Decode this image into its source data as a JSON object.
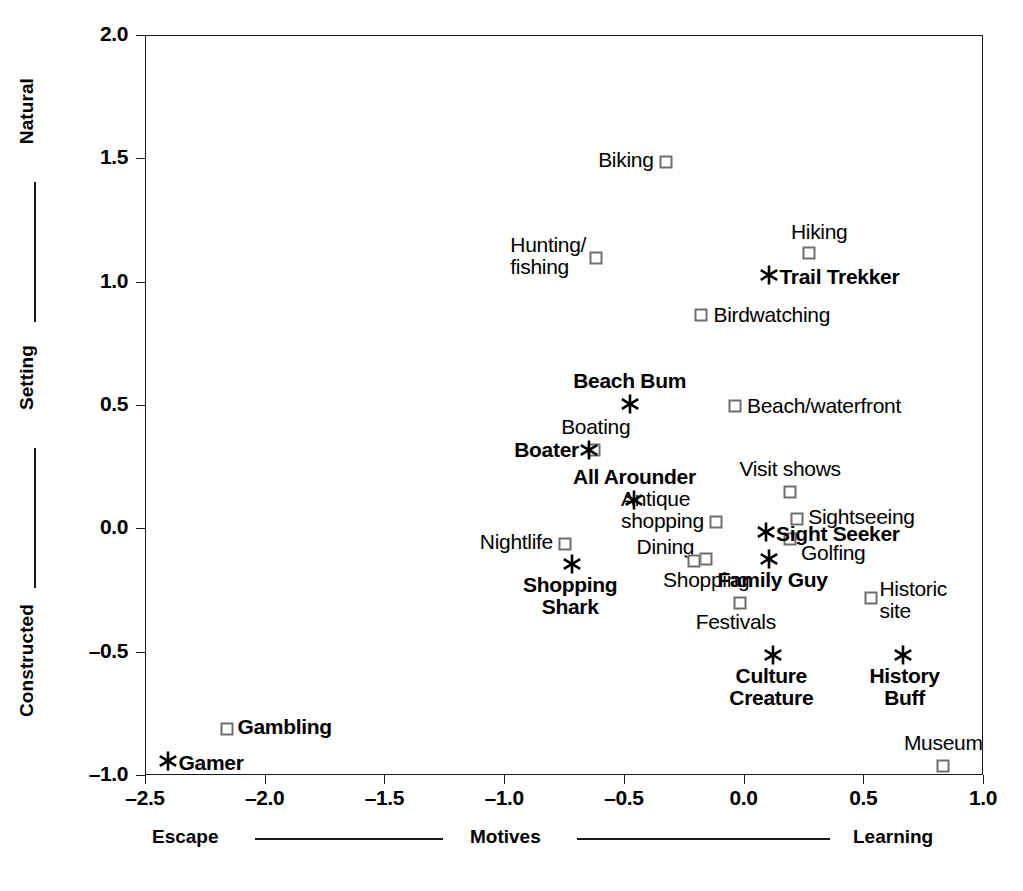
{
  "chart_data": {
    "type": "scatter",
    "title": "",
    "xlabel": "Motives",
    "ylabel": "Setting",
    "xlim": [
      -2.5,
      1.0
    ],
    "ylim": [
      -1.0,
      2.0
    ],
    "grid": false,
    "legend_position": "none",
    "x_axis": {
      "label": "Motives",
      "left_anchor": "Escape",
      "right_anchor": "Learning",
      "ticks": [
        "-2.5",
        "-2.0",
        "-1.5",
        "-1.0",
        "-0.5",
        "0.0",
        "0.5",
        "1.0"
      ],
      "tick_values": [
        -2.5,
        -2.0,
        -1.5,
        -1.0,
        -0.5,
        0.0,
        0.5,
        1.0
      ]
    },
    "y_axis": {
      "label": "Setting",
      "top_anchor": "Natural",
      "bottom_anchor": "Constructed",
      "ticks": [
        "2.0",
        "1.5",
        "1.0",
        "0.5",
        "0.0",
        "-0.5",
        "-1.0"
      ],
      "tick_values": [
        2.0,
        1.5,
        1.0,
        0.5,
        0.0,
        -0.5,
        -1.0
      ]
    },
    "series": [
      {
        "name": "Activities",
        "marker": "square",
        "marker_color": "#6e6e6e",
        "points": [
          {
            "label": "Biking",
            "x": -0.33,
            "y": 1.49,
            "anchor": "right",
            "bold": false,
            "dx": -12,
            "dy": -2
          },
          {
            "label": "Hiking",
            "x": 0.27,
            "y": 1.12,
            "anchor": "center-top",
            "bold": false,
            "dx": 10,
            "dy": -10
          },
          {
            "label": "Hunting/\nfishing",
            "x": -0.62,
            "y": 1.1,
            "anchor": "right",
            "bold": false,
            "dx": -10,
            "dy": -2
          },
          {
            "label": "Birdwatching",
            "x": -0.18,
            "y": 0.87,
            "anchor": "left",
            "bold": false,
            "dx": 12,
            "dy": 0
          },
          {
            "label": "Beach/waterfront",
            "x": -0.04,
            "y": 0.5,
            "anchor": "left",
            "bold": false,
            "dx": 12,
            "dy": 0
          },
          {
            "label": "Boating",
            "x": -0.63,
            "y": 0.32,
            "anchor": "center-top",
            "bold": false,
            "dx": 2,
            "dy": -12
          },
          {
            "label": "Visit shows",
            "x": 0.19,
            "y": 0.15,
            "anchor": "center-top",
            "bold": false,
            "dx": 0,
            "dy": -12
          },
          {
            "label": "Sightseeing",
            "x": 0.22,
            "y": 0.04,
            "anchor": "left",
            "bold": false,
            "dx": 11,
            "dy": -2
          },
          {
            "label": "Antique\nshopping",
            "x": -0.12,
            "y": 0.03,
            "anchor": "right",
            "bold": false,
            "dx": -12,
            "dy": -12
          },
          {
            "label": "Golfing",
            "x": 0.19,
            "y": -0.04,
            "anchor": "left",
            "bold": false,
            "dx": 11,
            "dy": 14
          },
          {
            "label": "Nightlife",
            "x": -0.75,
            "y": -0.06,
            "anchor": "right",
            "bold": false,
            "dx": -12,
            "dy": -2
          },
          {
            "label": "Dining",
            "x": -0.16,
            "y": -0.12,
            "anchor": "right",
            "bold": false,
            "dx": -12,
            "dy": -12
          },
          {
            "label": "Shopping",
            "x": -0.21,
            "y": -0.13,
            "anchor": "center-bot",
            "bold": false,
            "dx": 12,
            "dy": 8
          },
          {
            "label": "Festivals",
            "x": -0.02,
            "y": -0.3,
            "anchor": "center-bot",
            "bold": false,
            "dx": -4,
            "dy": 8
          },
          {
            "label": "Historic\nsite",
            "x": 0.53,
            "y": -0.28,
            "anchor": "left",
            "bold": false,
            "dx": 8,
            "dy": 2
          },
          {
            "label": "Museum",
            "x": 0.83,
            "y": -0.96,
            "anchor": "center-top",
            "bold": false,
            "dx": 0,
            "dy": -12
          },
          {
            "label": "Gambling",
            "x": -2.16,
            "y": -0.81,
            "anchor": "left",
            "bold": true,
            "dx": 10,
            "dy": -2
          }
        ]
      },
      {
        "name": "Traveler segments",
        "marker": "star",
        "marker_color": "#000000",
        "points": [
          {
            "label": "Trail Trekker",
            "x": 0.1,
            "y": 1.03,
            "anchor": "left",
            "bold": true,
            "dx": 11,
            "dy": 2
          },
          {
            "label": "Beach Bum",
            "x": -0.48,
            "y": 0.51,
            "anchor": "center-top",
            "bold": true,
            "dx": 0,
            "dy": -12
          },
          {
            "label": "Boater",
            "x": -0.65,
            "y": 0.32,
            "anchor": "right",
            "bold": true,
            "dx": -10,
            "dy": 0
          },
          {
            "label": "All Arounder",
            "x": -0.46,
            "y": 0.12,
            "anchor": "center-top",
            "bold": true,
            "dx": 0,
            "dy": -12
          },
          {
            "label": "Sight Seeker",
            "x": 0.09,
            "y": -0.01,
            "anchor": "left",
            "bold": true,
            "dx": 10,
            "dy": 2
          },
          {
            "label": "Family Guy",
            "x": 0.1,
            "y": -0.12,
            "anchor": "center-bot",
            "bold": true,
            "dx": 4,
            "dy": 10
          },
          {
            "label": "Shopping\nShark",
            "x": -0.72,
            "y": -0.14,
            "anchor": "center-bot",
            "bold": true,
            "dx": -2,
            "dy": 10
          },
          {
            "label": "Culture\nCreature",
            "x": 0.12,
            "y": -0.51,
            "anchor": "center-bot",
            "bold": true,
            "dx": -2,
            "dy": 10
          },
          {
            "label": "History\nBuff",
            "x": 0.66,
            "y": -0.51,
            "anchor": "center-bot",
            "bold": true,
            "dx": 2,
            "dy": 10
          },
          {
            "label": "Gamer",
            "x": -2.41,
            "y": -0.94,
            "anchor": "left",
            "bold": true,
            "dx": 11,
            "dy": 2
          }
        ]
      }
    ]
  }
}
